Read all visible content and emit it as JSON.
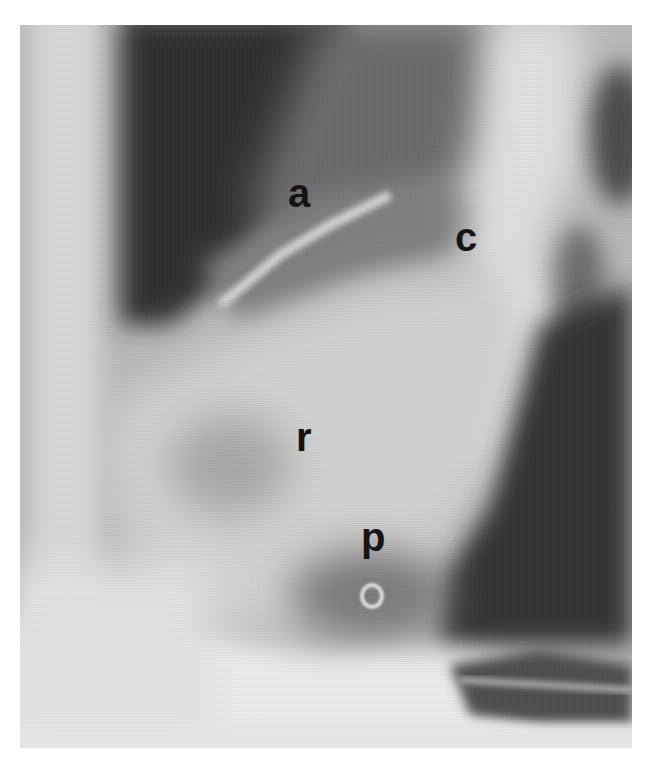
{
  "figure": {
    "type": "radiograph",
    "labels": [
      {
        "id": "a",
        "text": "a",
        "x": 268,
        "y": 148
      },
      {
        "id": "c",
        "text": "c",
        "x": 435,
        "y": 192
      },
      {
        "id": "r",
        "text": "r",
        "x": 276,
        "y": 392
      },
      {
        "id": "p",
        "text": "p",
        "x": 341,
        "y": 492
      }
    ],
    "colors": {
      "background": "#ffffff",
      "label": "#141414",
      "dark_lung": "#3a3a3a",
      "soft_tissue": "#c8c8c8",
      "bright_bone": "#efefef"
    }
  }
}
